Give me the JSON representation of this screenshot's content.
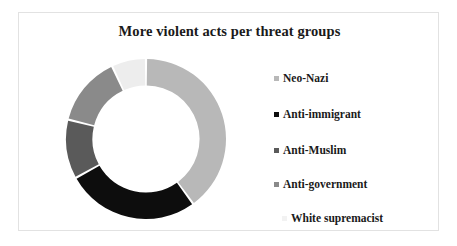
{
  "frame": {
    "border_color": "#e2e2e2",
    "background": "#ffffff"
  },
  "chart_data": {
    "type": "pie",
    "variant": "doughnut",
    "title": "More violent acts per threat groups",
    "xlabel": "",
    "ylabel": "",
    "legend_position": "right",
    "grid": false,
    "start_angle_deg": 0,
    "direction": "clockwise",
    "inner_radius_ratio": 0.67,
    "categories": [
      "Neo-Nazi",
      "Anti-immigrant",
      "Anti-Muslim",
      "Anti-government",
      "White supremacist"
    ],
    "values": [
      40,
      27,
      12,
      14,
      7
    ],
    "units": "percent",
    "slices": [
      {
        "label": "Neo-Nazi",
        "value": 40,
        "color": "#b8b8b8",
        "start_deg": 0,
        "end_deg": 144
      },
      {
        "label": "Anti-immigrant",
        "value": 27,
        "color": "#0d0d0d",
        "start_deg": 144,
        "end_deg": 241
      },
      {
        "label": "Anti-Muslim",
        "value": 12,
        "color": "#5a5a5a",
        "start_deg": 241,
        "end_deg": 284
      },
      {
        "label": "Anti-government",
        "value": 14,
        "color": "#8a8a8a",
        "start_deg": 284,
        "end_deg": 335
      },
      {
        "label": "White supremacist",
        "value": 7,
        "color": "#ededed",
        "start_deg": 335,
        "end_deg": 360
      }
    ]
  },
  "legend": {
    "items": [
      {
        "label": "Neo-Nazi",
        "color": "#b8b8b8",
        "top": 14
      },
      {
        "label": "Anti-immigrant",
        "color": "#0d0d0d",
        "top": 50
      },
      {
        "label": "Anti-Muslim",
        "color": "#5a5a5a",
        "top": 86
      },
      {
        "label": "Anti-government",
        "color": "#8a8a8a",
        "top": 120
      },
      {
        "label": "White supremacist",
        "color": "#f2f2f2",
        "top": 154,
        "indent": 8
      }
    ]
  }
}
